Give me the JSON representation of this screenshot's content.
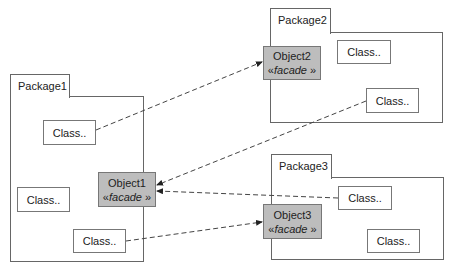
{
  "packages": [
    {
      "name": "Package1",
      "tab": {
        "x": 10,
        "y": 74,
        "w": 60,
        "h": 23
      },
      "body": {
        "x": 10,
        "y": 96,
        "w": 134,
        "h": 166
      }
    },
    {
      "name": "Package2",
      "tab": {
        "x": 270,
        "y": 8,
        "w": 61,
        "h": 25
      },
      "body": {
        "x": 270,
        "y": 32,
        "w": 173,
        "h": 91
      }
    },
    {
      "name": "Package3",
      "tab": {
        "x": 271,
        "y": 154,
        "w": 61,
        "h": 24
      },
      "body": {
        "x": 271,
        "y": 177,
        "w": 173,
        "h": 83
      }
    }
  ],
  "classes": [
    {
      "label": "Class..",
      "x": 43,
      "y": 120,
      "w": 53,
      "h": 25
    },
    {
      "label": "Class..",
      "x": 17,
      "y": 187,
      "w": 53,
      "h": 25
    },
    {
      "label": "Class..",
      "x": 73,
      "y": 229,
      "w": 53,
      "h": 24
    },
    {
      "label": "Class..",
      "x": 337,
      "y": 40,
      "w": 54,
      "h": 24
    },
    {
      "label": "Class..",
      "x": 366,
      "y": 88,
      "w": 53,
      "h": 25
    },
    {
      "label": "Class..",
      "x": 338,
      "y": 186,
      "w": 54,
      "h": 24
    },
    {
      "label": "Class..",
      "x": 367,
      "y": 229,
      "w": 53,
      "h": 24
    }
  ],
  "objects": [
    {
      "name": "Object1",
      "stereotype_open": "«",
      "stereotype": "facade",
      "stereotype_close": " »",
      "x": 98,
      "y": 172,
      "w": 58,
      "h": 35
    },
    {
      "name": "Object2",
      "stereotype_open": "«",
      "stereotype": "facade",
      "stereotype_close": " »",
      "x": 263,
      "y": 46,
      "w": 58,
      "h": 34
    },
    {
      "name": "Object3",
      "stereotype_open": "«",
      "stereotype": "facade",
      "stereotype_close": " »",
      "x": 263,
      "y": 204,
      "w": 59,
      "h": 35
    }
  ],
  "dependencies": [
    {
      "from": "Package1.Class1",
      "to": "Object2",
      "x1": 96,
      "y1": 130,
      "x2": 262,
      "y2": 62
    },
    {
      "from": "Package2.Class2",
      "to": "Object1",
      "x1": 366,
      "y1": 101,
      "x2": 157,
      "y2": 185
    },
    {
      "from": "Package3.Class1",
      "to": "Object1",
      "x1": 338,
      "y1": 198,
      "x2": 157,
      "y2": 191
    },
    {
      "from": "Package1.Class3",
      "to": "Object3",
      "x1": 126,
      "y1": 241,
      "x2": 262,
      "y2": 222
    }
  ],
  "colors": {
    "line": "#444444",
    "object_fill": "#bdbdbd",
    "border": "#666666"
  }
}
